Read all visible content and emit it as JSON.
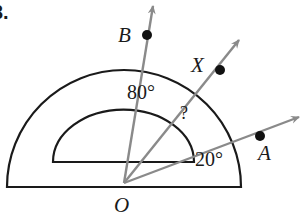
{
  "problem": {
    "number_label": "3."
  },
  "colors": {
    "protractor_stroke": "#1a1a1a",
    "ray_stroke": "#8a8a8a",
    "point_fill": "#111111"
  },
  "protractor": {
    "center": [
      124,
      187
    ],
    "outer_radius": 117,
    "inner_rx": 70,
    "inner_ry": 52,
    "inner_baseline_y": 162
  },
  "vertex": {
    "label": "O",
    "x": 124,
    "y": 183
  },
  "rays": [
    {
      "name": "B",
      "tip": [
        154,
        2
      ],
      "point": [
        147,
        35
      ]
    },
    {
      "name": "X",
      "tip": [
        242,
        37
      ],
      "point": [
        220,
        70
      ]
    },
    {
      "name": "A",
      "tip": [
        303,
        115
      ],
      "point": [
        260,
        136
      ]
    }
  ],
  "labels": {
    "B": "B",
    "X": "X",
    "A": "A",
    "O": "O",
    "angle_80": "80°",
    "angle_20": "20°",
    "unknown": "?"
  }
}
